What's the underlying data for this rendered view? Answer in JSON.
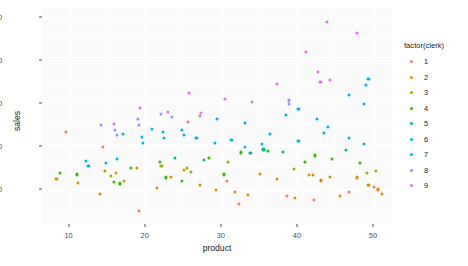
{
  "chart_data": {
    "type": "scatter",
    "title": "",
    "xlabel": "product",
    "ylabel": "sales",
    "xlim": [
      6.5,
      52.5
    ],
    "ylim": [
      20,
      520
    ],
    "xticks": [
      10,
      20,
      30,
      40,
      50
    ],
    "yticks": [
      100,
      200,
      300,
      400,
      500
    ],
    "grid": true,
    "legend": {
      "title": "factor(clerk)",
      "position": "right",
      "entries": [
        {
          "label": "1",
          "color": "#f8766d"
        },
        {
          "label": "2",
          "color": "#d89000"
        },
        {
          "label": "3",
          "color": "#a3a500"
        },
        {
          "label": "4",
          "color": "#39b600"
        },
        {
          "label": "5",
          "color": "#00bf7d"
        },
        {
          "label": "6",
          "color": "#00bfc4"
        },
        {
          "label": "7",
          "color": "#00b0f6"
        },
        {
          "label": "8",
          "color": "#9590ff"
        },
        {
          "label": "9",
          "color": "#e76bf3"
        }
      ]
    },
    "series": [
      {
        "name": "1",
        "color": "#f8766d",
        "points": [
          [
            9.6,
            232
          ],
          [
            14.5,
            196
          ],
          [
            19.2,
            48
          ],
          [
            25.7,
            255
          ],
          [
            30.8,
            118
          ],
          [
            32.4,
            64
          ],
          [
            38.7,
            83
          ],
          [
            42.3,
            73
          ],
          [
            46.8,
            92
          ],
          [
            50.1,
            104
          ]
        ]
      },
      {
        "name": "2",
        "color": "#d89000",
        "points": [
          [
            8.4,
            122
          ],
          [
            11.2,
            113
          ],
          [
            14.1,
            88
          ],
          [
            16.2,
            136
          ],
          [
            17.3,
            118
          ],
          [
            19.0,
            147
          ],
          [
            21.6,
            101
          ],
          [
            23.4,
            128
          ],
          [
            25.1,
            143
          ],
          [
            27.2,
            109
          ],
          [
            29.4,
            96
          ],
          [
            31.8,
            92
          ],
          [
            33.6,
            85
          ],
          [
            35.2,
            135
          ],
          [
            37.4,
            123
          ],
          [
            39.8,
            78
          ],
          [
            41.6,
            131
          ],
          [
            43.2,
            119
          ],
          [
            45.7,
            83
          ],
          [
            47.9,
            126
          ],
          [
            49.4,
            108
          ],
          [
            50.6,
            98
          ],
          [
            51.2,
            88
          ]
        ]
      },
      {
        "name": "3",
        "color": "#a3a500",
        "points": [
          [
            14.8,
            142
          ],
          [
            15.6,
            129
          ],
          [
            22.2,
            152
          ],
          [
            25.5,
            147
          ],
          [
            26.1,
            138
          ],
          [
            30.9,
            161
          ],
          [
            39.6,
            146
          ],
          [
            42.1,
            131
          ],
          [
            44.3,
            128
          ],
          [
            49.2,
            137
          ],
          [
            50.4,
            141
          ]
        ]
      },
      {
        "name": "4",
        "color": "#39b600",
        "points": [
          [
            8.9,
            136
          ],
          [
            11.1,
            133
          ],
          [
            15.9,
            115
          ],
          [
            16.8,
            112
          ],
          [
            18.2,
            149
          ],
          [
            22.0,
            163
          ],
          [
            22.8,
            126
          ],
          [
            24.9,
            118
          ],
          [
            28.4,
            171
          ],
          [
            30.4,
            133
          ],
          [
            32.6,
            184
          ],
          [
            36.2,
            188
          ],
          [
            41.1,
            162
          ],
          [
            42.4,
            177
          ],
          [
            44.6,
            168
          ],
          [
            48.3,
            159
          ]
        ]
      },
      {
        "name": "5",
        "color": "#00bf7d",
        "points": [
          [
            24.0,
            172
          ],
          [
            27.8,
            167
          ],
          [
            33.9,
            182
          ],
          [
            35.6,
            191
          ],
          [
            38.2,
            186
          ],
          [
            46.4,
            189
          ]
        ]
      },
      {
        "name": "6",
        "color": "#00bfc4",
        "points": [
          [
            17.1,
            228
          ],
          [
            22.5,
            218
          ],
          [
            29.2,
            207
          ],
          [
            31.4,
            214
          ],
          [
            33.2,
            196
          ],
          [
            35.4,
            203
          ],
          [
            40.2,
            211
          ],
          [
            43.6,
            229
          ],
          [
            46.9,
            218
          ],
          [
            48.8,
            203
          ]
        ]
      },
      {
        "name": "7",
        "color": "#00b0f6",
        "points": [
          [
            12.3,
            164
          ],
          [
            12.6,
            153
          ],
          [
            14.9,
            159
          ],
          [
            16.4,
            168
          ],
          [
            19.6,
            221
          ],
          [
            19.8,
            207
          ],
          [
            21.0,
            238
          ],
          [
            22.4,
            232
          ],
          [
            24.9,
            236
          ],
          [
            25.1,
            224
          ],
          [
            26.8,
            218
          ],
          [
            29.5,
            262
          ],
          [
            33.2,
            252
          ],
          [
            36.4,
            228
          ],
          [
            38.6,
            272
          ],
          [
            40.2,
            286
          ],
          [
            42.6,
            263
          ],
          [
            44.1,
            243
          ],
          [
            46.9,
            318
          ],
          [
            48.8,
            296
          ],
          [
            49.1,
            341
          ],
          [
            49.4,
            356
          ]
        ]
      },
      {
        "name": "8",
        "color": "#9590ff",
        "points": [
          [
            14.2,
            247
          ],
          [
            16.1,
            236
          ],
          [
            16.3,
            224
          ],
          [
            19.1,
            263
          ],
          [
            19.3,
            249
          ],
          [
            22.1,
            273
          ],
          [
            23.6,
            266
          ],
          [
            27.3,
            269
          ],
          [
            38.9,
            305
          ],
          [
            39.0,
            296
          ]
        ]
      },
      {
        "name": "9",
        "color": "#e76bf3",
        "points": [
          [
            16.0,
            251
          ],
          [
            19.4,
            287
          ],
          [
            23.1,
            278
          ],
          [
            25.8,
            322
          ],
          [
            27.4,
            276
          ],
          [
            30.6,
            309
          ],
          [
            34.1,
            302
          ],
          [
            37.4,
            344
          ],
          [
            41.2,
            418
          ],
          [
            42.8,
            372
          ],
          [
            43.1,
            347
          ],
          [
            43.9,
            488
          ],
          [
            44.3,
            352
          ],
          [
            47.9,
            463
          ]
        ]
      }
    ]
  }
}
